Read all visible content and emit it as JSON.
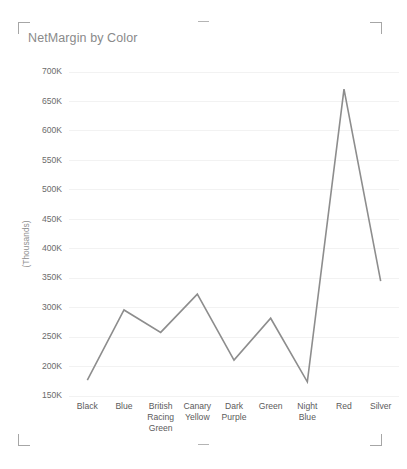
{
  "visual": {
    "title": "NetMargin by Color",
    "title_color": "#8a8a8a",
    "background": "#ffffff",
    "selected": true,
    "handles": {
      "top_left": "resize-handle-top-left",
      "top_right": "resize-handle-top-right",
      "bottom_left": "resize-handle-bottom-left",
      "bottom_right": "resize-handle-bottom-right",
      "top_middle": "resize-handle-top-middle",
      "bottom_middle": "resize-handle-bottom-middle"
    }
  },
  "chart_data": {
    "type": "line",
    "title": "NetMargin by Color",
    "xlabel": "",
    "ylabel": "(Thousands)",
    "categories": [
      "Black",
      "British Racing Green",
      "Blue",
      "Canary Yellow",
      "Dark Purple",
      "Green",
      "Night Blue",
      "Red",
      "Silver"
    ],
    "category_labels": [
      [
        "Black"
      ],
      [
        "Blue"
      ],
      [
        "British",
        "Racing",
        "Green"
      ],
      [
        "Canary",
        "Yellow"
      ],
      [
        "Dark",
        "Purple"
      ],
      [
        "Green"
      ],
      [
        "Night",
        "Blue"
      ],
      [
        "Red"
      ],
      [
        "Silver"
      ]
    ],
    "category_order": [
      "Black",
      "Blue",
      "British Racing Green",
      "Canary Yellow",
      "Dark Purple",
      "Green",
      "Night Blue",
      "Red",
      "Silver"
    ],
    "values": [
      177000,
      296000,
      258000,
      323000,
      211000,
      282000,
      174000,
      671000,
      345000
    ],
    "values_display": [
      "177K",
      "296K",
      "258K",
      "323K",
      "211K",
      "282K",
      "174K",
      "671K",
      "345K"
    ],
    "ylim": [
      150000,
      700000
    ],
    "ytick_values": [
      150000,
      200000,
      250000,
      300000,
      350000,
      400000,
      450000,
      500000,
      550000,
      600000,
      650000,
      700000
    ],
    "ytick_labels": [
      "150K",
      "200K",
      "250K",
      "300K",
      "350K",
      "400K",
      "450K",
      "500K",
      "550K",
      "600K",
      "650K",
      "700K"
    ],
    "grid": true,
    "legend": "none",
    "series": [
      {
        "name": "NetMargin",
        "color": "#8d8d8d",
        "values": [
          177000,
          296000,
          258000,
          323000,
          211000,
          282000,
          174000,
          671000,
          345000
        ]
      }
    ]
  }
}
